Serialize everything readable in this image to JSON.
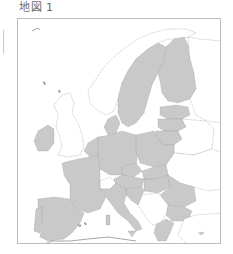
{
  "figure": {
    "title": "地図 1"
  },
  "map": {
    "region": "Europe",
    "legend": [],
    "colors": {
      "eu_member": "#c9c9c9",
      "non_member": "#ffffff",
      "border": "#7a7a7a",
      "frame": "#bdbdbd"
    },
    "highlighted_regions": [
      "Portugal",
      "Spain",
      "France",
      "Ireland",
      "Belgium",
      "Netherlands",
      "Luxembourg",
      "Germany",
      "Denmark",
      "Sweden",
      "Finland",
      "Estonia",
      "Latvia",
      "Lithuania",
      "Poland",
      "Czechia",
      "Slovakia",
      "Austria",
      "Slovenia",
      "Croatia",
      "Hungary",
      "Italy",
      "Romania",
      "Bulgaria",
      "Greece",
      "Malta",
      "Cyprus"
    ],
    "unhighlighted_regions": [
      "United Kingdom",
      "Norway",
      "Iceland",
      "Switzerland",
      "Belarus",
      "Ukraine",
      "Moldova",
      "Russia",
      "Serbia",
      "Bosnia and Herzegovina",
      "Montenegro",
      "Albania",
      "North Macedonia",
      "Turkey"
    ]
  }
}
